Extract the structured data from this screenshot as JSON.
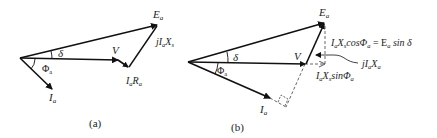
{
  "diagram_a": {
    "caption": "(a)",
    "labels": {
      "ea": "E",
      "ea_sub": "a",
      "jiaxs_j": "jI",
      "jiaxs_a": "a",
      "jiaxs_x": "X",
      "jiaxs_s": "s",
      "v": "V",
      "iara_i": "I",
      "iara_a": "a",
      "iara_r": "R",
      "iara_a2": "a",
      "delta": "δ",
      "phi": "Φ",
      "phi_sub": "a",
      "ia": "I",
      "ia_sub": "a"
    }
  },
  "diagram_b": {
    "caption": "(b)",
    "labels": {
      "ea": "E",
      "ea_sub": "a",
      "cos_eq_i": "I",
      "cos_eq_a": "a",
      "cos_eq_x": "X",
      "cos_eq_s": "s",
      "cos_eq_cos": "cosΦ",
      "cos_eq_a2": "a",
      "cos_eq_rhs": " = E",
      "cos_eq_a3": "a",
      "cos_eq_sin": " sin δ",
      "jiaxa_j": "jI",
      "jiaxa_a": "a",
      "jiaxa_x": "X",
      "jiaxa_a2": "a",
      "sin_i": "I",
      "sin_a": "a",
      "sin_x": "X",
      "sin_s": "s",
      "sin_sin": "sinΦ",
      "sin_a2": "a",
      "v": "V",
      "delta": "δ",
      "phi": "Φ",
      "phi_sub": "a",
      "ia": "I",
      "ia_sub": "a"
    }
  },
  "colors": {
    "stroke": "#111111",
    "dashed": "#555555",
    "text": "#222222"
  }
}
